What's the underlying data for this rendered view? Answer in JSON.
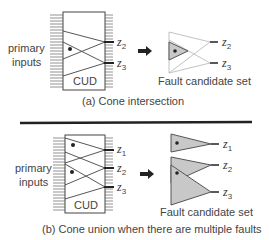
{
  "panels": [
    {
      "caption": "(a) Cone intersection",
      "input_label_line1": "primary",
      "input_label_line2": "inputs",
      "block_label": "CUD",
      "outputs": [
        {
          "name": "z",
          "sub": "2"
        },
        {
          "name": "z",
          "sub": "3"
        }
      ],
      "result_label": "Fault candidate set",
      "result_outputs": [
        {
          "name": "z",
          "sub": "2"
        },
        {
          "name": "z",
          "sub": "3"
        }
      ]
    },
    {
      "caption": "(b) Cone union when there are multiple faults",
      "input_label_line1": "primary",
      "input_label_line2": "inputs",
      "block_label": "CUD",
      "outputs": [
        {
          "name": "z",
          "sub": "1"
        },
        {
          "name": "z",
          "sub": "2"
        },
        {
          "name": "z",
          "sub": "3"
        }
      ],
      "result_label": "Fault candidate set",
      "result_outputs": [
        {
          "name": "z",
          "sub": "1"
        },
        {
          "name": "z",
          "sub": "2"
        },
        {
          "name": "z",
          "sub": "3"
        }
      ]
    }
  ],
  "colors": {
    "line": "#444444",
    "cone_fill": "#c8c8c8",
    "faint_line": "#bbbbbb",
    "divider": "#222222"
  }
}
